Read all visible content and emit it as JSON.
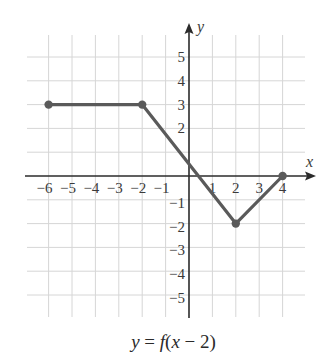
{
  "chart_data": {
    "type": "line",
    "title": "",
    "caption": "y = f(x − 2)",
    "xlabel": "x",
    "ylabel": "y",
    "xlim": [
      -7,
      5
    ],
    "ylim": [
      -6,
      6
    ],
    "grid": true,
    "x_ticks": [
      -6,
      -5,
      -4,
      -3,
      -2,
      -1,
      1,
      2,
      3,
      4
    ],
    "y_ticks": [
      5,
      4,
      3,
      2,
      1,
      -1,
      -2,
      -3,
      -4,
      -5
    ],
    "x_tick_labels": [
      "−6",
      "−5",
      "−4",
      "−3",
      "−2",
      "−1",
      "1",
      "2",
      "3",
      "4"
    ],
    "y_tick_labels": [
      "5",
      "4",
      "3",
      "2",
      "−1",
      "−2",
      "−3",
      "−4",
      "−5"
    ],
    "series": [
      {
        "name": "y = f(x − 2)",
        "points": [
          [
            -6,
            3
          ],
          [
            -2,
            3
          ],
          [
            2,
            -2
          ],
          [
            4,
            0
          ]
        ],
        "endpoints_marked": [
          [
            -6,
            3
          ],
          [
            -2,
            3
          ],
          [
            2,
            -2
          ],
          [
            4,
            0
          ]
        ],
        "color": "#5a5a5a"
      }
    ],
    "colors": {
      "grid": "#d6d6d6",
      "axis": "#2b2b2b",
      "line": "#5a5a5a"
    }
  },
  "caption": {
    "text_y": "y",
    "text_eq": " = ",
    "text_f": "f",
    "text_open": "(",
    "text_x": "x",
    "text_rest": " − 2)"
  },
  "labels": {
    "x": "x",
    "y": "y"
  }
}
